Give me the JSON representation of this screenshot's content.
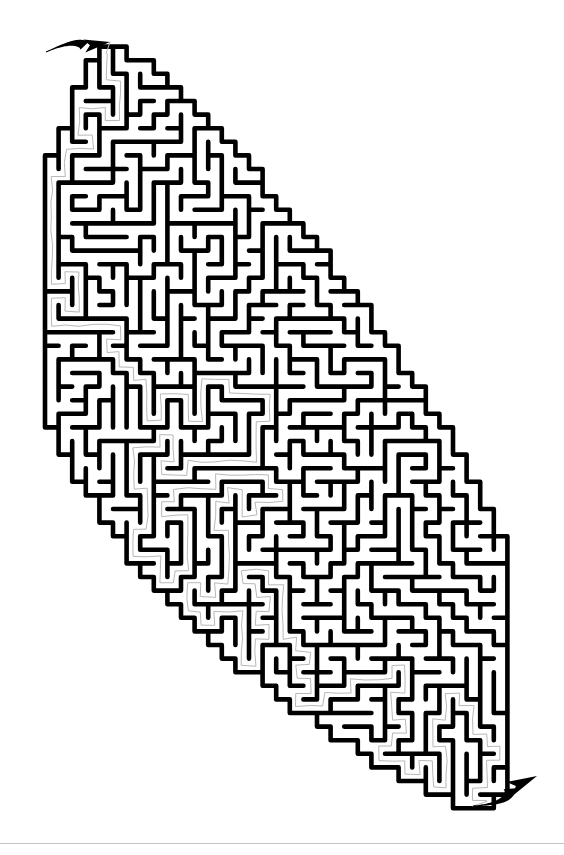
{
  "page": {
    "background_color": "#ffffff",
    "width": 564,
    "height": 855
  },
  "header": {
    "clipped_text": "printable maze page",
    "visible": true,
    "color": "#c9c9c9"
  },
  "maze": {
    "name": "leaf-shaped-maze",
    "shape": "leaf",
    "wall_color": "#000000",
    "path_color": "#b8b8b8",
    "background_color": "#ffffff",
    "wall_thickness": 4.6,
    "solution_thickness": 1.0,
    "cell_size": 13.6,
    "seed": 20240517,
    "bounds": {
      "x": 45,
      "y": 33,
      "width": 468,
      "height": 784
    },
    "leaf": {
      "tip_top": {
        "x": 112,
        "y": 36
      },
      "tip_bottom": {
        "x": 492,
        "y": 812
      },
      "widest_left": {
        "x": 47,
        "y": 430
      },
      "widest_right": {
        "x": 511,
        "y": 545
      },
      "left_bulge": 0.5,
      "right_bulge": 0.52
    },
    "entrance": {
      "label": "entrance-arrow",
      "from": {
        "x": 46,
        "y": 52
      },
      "to": {
        "x": 110,
        "y": 42
      },
      "direction": "right"
    },
    "exit": {
      "label": "exit-arrow",
      "from": {
        "x": 473,
        "y": 806
      },
      "to": {
        "x": 537,
        "y": 776
      },
      "direction": "right-up"
    }
  },
  "footer": {
    "rule_color": "#c4c4c4",
    "rule_y": 843
  }
}
